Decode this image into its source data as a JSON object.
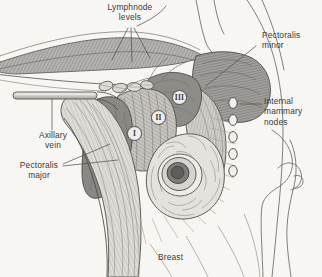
{
  "figure": {
    "background_color": "#f7f6f2",
    "ink_color": "#3b3a38",
    "width": 322,
    "height": 277
  },
  "labels": {
    "lymphnode_levels": "Lymphnode\nlevels",
    "pectoralis_minor": "Pectoralis\nminor",
    "internal_mammary_nodes": "Internal\nmammary\nnodes",
    "axillary_vein": "Axillary\nvein",
    "pectoralis_major": "Pectoralis\nmajor",
    "breast": "Breast"
  },
  "levels": [
    {
      "id": "level-1",
      "numeral": "I",
      "x": 127,
      "y": 126
    },
    {
      "id": "level-2",
      "numeral": "II",
      "x": 151,
      "y": 110
    },
    {
      "id": "level-3",
      "numeral": "III",
      "x": 172,
      "y": 90
    }
  ],
  "internal_mammary_nodes": {
    "count": 5,
    "positions": [
      {
        "cx": 233,
        "cy": 103
      },
      {
        "cx": 233,
        "cy": 120
      },
      {
        "cx": 233,
        "cy": 137
      },
      {
        "cx": 233,
        "cy": 154
      },
      {
        "cx": 233,
        "cy": 171
      }
    ]
  },
  "colors": {
    "muscle_dark": "#8c8a88",
    "muscle_mid": "#a8a6a2",
    "muscle_light": "#c3c1bc",
    "vein": "#d8d6d1",
    "tumor_core": "#6f6d6b",
    "tumor_ring": "#b9b6b1",
    "outline": "#55534f",
    "leader_line": "#6a6865"
  }
}
